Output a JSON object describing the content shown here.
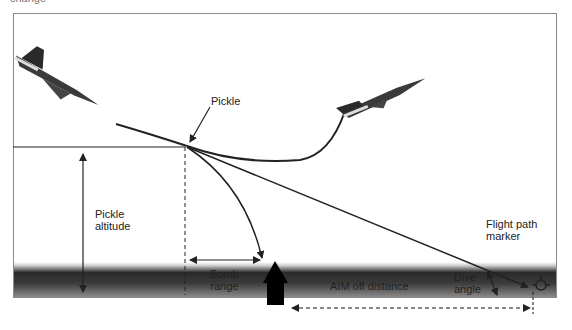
{
  "top_caption": "change",
  "labels": {
    "pickle": "Pickle",
    "pickle_altitude_line1": "Pickle",
    "pickle_altitude_line2": "altitude",
    "bomb_range_line1": "Bomb",
    "bomb_range_line2": "range",
    "aim_off_distance": "AIM off distance",
    "flight_path_marker_line1": "Flight path",
    "flight_path_marker_line2": "marker",
    "dive_angle_line1": "Dive",
    "dive_angle_line2": "angle"
  },
  "icons": {
    "left_jet": "diving-jet-icon",
    "right_jet": "climbing-jet-icon",
    "target": "target-house-icon",
    "fpm": "flight-path-marker-icon"
  },
  "colors": {
    "line": "#222222",
    "ground_dark": "#2a2a2a",
    "frame": "#8a8a8a"
  }
}
